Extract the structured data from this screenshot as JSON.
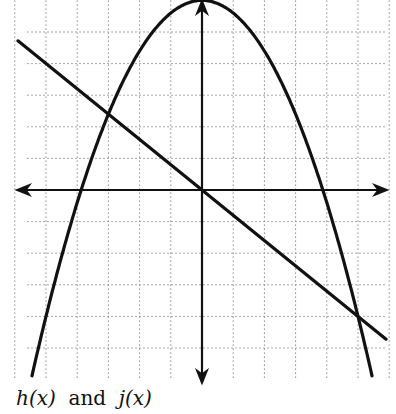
{
  "caption": {
    "h_label": "h(x)",
    "connector": "and",
    "j_label": "j(x)"
  },
  "colors": {
    "curve": "#111111",
    "axis": "#111111",
    "grid": "#8a8a8a",
    "background": "#ffffff"
  },
  "chart_data": {
    "type": "line",
    "title": "",
    "caption": "h(x) and j(x)",
    "xlabel": "",
    "ylabel": "",
    "xlim": [
      -6,
      6
    ],
    "ylim": [
      -6,
      6
    ],
    "grid": true,
    "grid_style": "dotted",
    "grid_step": 1,
    "tick_labels": false,
    "legend": null,
    "series": [
      {
        "name": "h(x)",
        "kind": "parabola (downward)",
        "equation": "h(x) = 6 - 0.4x^2",
        "vertex": [
          0,
          6
        ],
        "x_intercepts": [
          -3.87,
          3.87
        ],
        "x": [
          -5.5,
          -5,
          -4,
          -3,
          -2,
          -1,
          0,
          1,
          2,
          3,
          4,
          5,
          5.5
        ],
        "values": [
          -6.1,
          -4,
          -0.4,
          2.4,
          4.4,
          5.6,
          6,
          5.6,
          4.4,
          2.4,
          -0.4,
          -4,
          -6.1
        ]
      },
      {
        "name": "j(x)",
        "kind": "line",
        "equation": "j(x) = -0.8x",
        "x": [
          -5.9,
          -3,
          0,
          5,
          5.9
        ],
        "values": [
          4.72,
          2.4,
          0,
          -4,
          -4.72
        ]
      }
    ],
    "intersections": [
      [
        -3,
        2.4
      ],
      [
        5,
        -4
      ]
    ]
  }
}
